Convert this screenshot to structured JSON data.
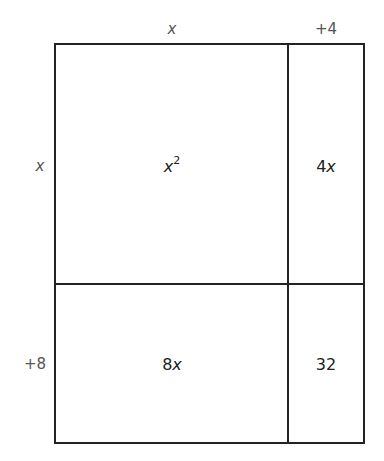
{
  "diagram": {
    "type": "area-model",
    "top_labels": [
      {
        "var": "x",
        "text": ""
      },
      {
        "var": "",
        "text": "+4"
      }
    ],
    "side_labels": [
      {
        "var": "x",
        "text": ""
      },
      {
        "var": "",
        "text": "+8"
      }
    ],
    "cells": {
      "top_left": {
        "var": "x",
        "exp": "2"
      },
      "top_right": {
        "coef": "4",
        "var": "x"
      },
      "bottom_left": {
        "coef": "8",
        "var": "x"
      },
      "bottom_right": {
        "text": "32"
      }
    },
    "line_color": "#222222",
    "label_color": "#555555"
  }
}
